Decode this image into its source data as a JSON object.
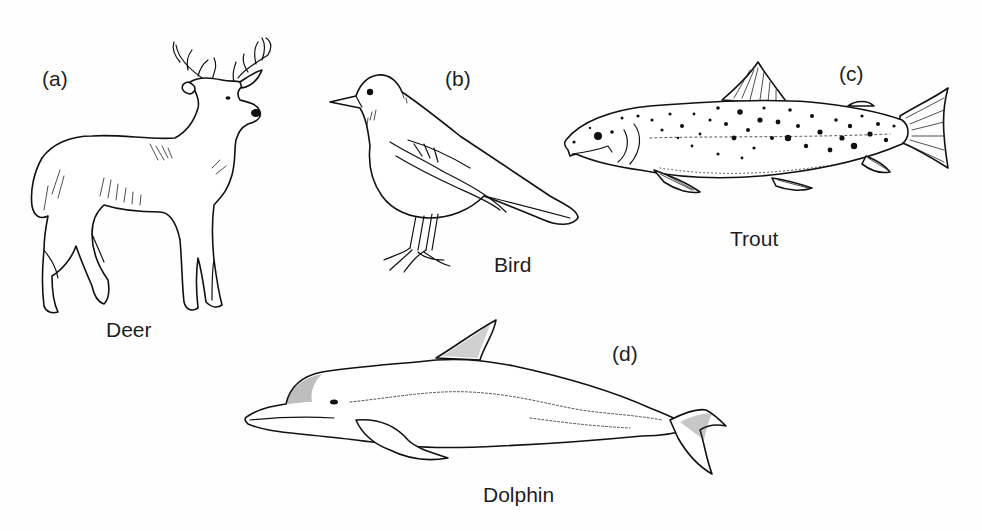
{
  "figure": {
    "panels": [
      {
        "id": "a",
        "letter": "(a)",
        "name": "Deer"
      },
      {
        "id": "b",
        "letter": "(b)",
        "name": "Bird"
      },
      {
        "id": "c",
        "letter": "(c)",
        "name": "Trout"
      },
      {
        "id": "d",
        "letter": "(d)",
        "name": "Dolphin"
      }
    ]
  },
  "colors": {
    "background": "#fefefe",
    "ink": "#111111"
  }
}
